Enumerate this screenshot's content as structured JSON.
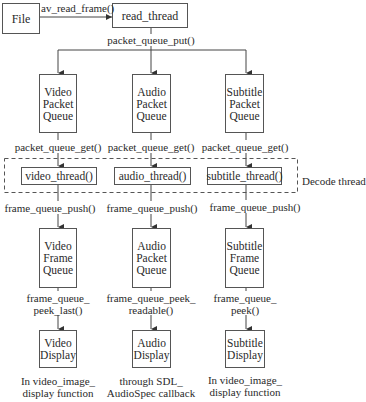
{
  "diagram": {
    "source": {
      "label": "File"
    },
    "reader": {
      "label": "read_thread"
    },
    "edges": {
      "file_to_reader": "av_read_frame()",
      "reader_to_queues": "packet_queue_put()"
    },
    "decode_group_label": "Decode thread",
    "columns": [
      {
        "id": "video",
        "packet_queue": "Video\nPacket\nQueue",
        "get_label": "packet_queue_get()",
        "thread": "video_thread()",
        "push_label": "frame_queue_push()",
        "frame_queue": "Video\nFrame\nQueue",
        "peek_label": "frame_queue_\npeek_last()",
        "display": "Video\nDisplay",
        "caption": "In video_image_\ndisplay function"
      },
      {
        "id": "audio",
        "packet_queue": "Audio\nPacket\nQueue",
        "get_label": "packet_queue_get()",
        "thread": "audio_thread()",
        "push_label": "frame_queue_push()",
        "frame_queue": "Audio\nPacket\nQueue",
        "peek_label": "frame_queue_peek_\nreadable()",
        "display": "Audio\nDisplay",
        "caption": "through SDL_\nAudioSpec callback"
      },
      {
        "id": "subtitle",
        "packet_queue": "Subtitle\nPacket\nQueue",
        "get_label": "packet_queue_get()",
        "thread": "subtitle_thread()",
        "push_label": "frame_queue_push()",
        "frame_queue": "Subtitle\nFrame\nQueue",
        "peek_label": "frame_queue_\npeek()",
        "display": "Subtitle\nDisplay",
        "caption": "In video_image_\ndisplay function"
      }
    ],
    "colors": {
      "line": "#444444",
      "box_border": "#555555",
      "text": "#2a2a2a",
      "background": "#ffffff"
    }
  }
}
